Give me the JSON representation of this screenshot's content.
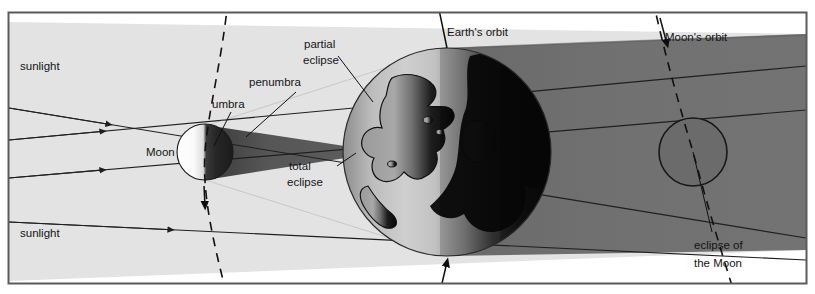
{
  "diagram": {
    "subject": "eclipse of the Moon",
    "labels": {
      "sunlight_top": "sunlight",
      "sunlight_bottom": "sunlight",
      "moon": "Moon",
      "umbra": "umbra",
      "penumbra": "penumbra",
      "partial_eclipse": "partial\neclipse",
      "partial_eclipse_line1": "partial",
      "partial_eclipse_line2": "eclipse",
      "total_eclipse_line1": "total",
      "total_eclipse_line2": "eclipse",
      "earths_orbit": "Earth's orbit",
      "moons_orbit": "Moon's orbit",
      "eclipse_of_moon_line1": "eclipse of",
      "eclipse_of_moon_line2": "the Moon"
    },
    "colors": {
      "frame_border": "#5a5a5a",
      "page_background": "#ffffff",
      "sunlight_beam": "#e3e3e3",
      "penumbra_fill": "#e1e1e1",
      "umbra_fill": "#4c4c4c",
      "earth_shadow": "#6e6e6e",
      "earth_lit": "#b6b6b6",
      "earth_dark": "#111111",
      "moon_lit": "#fbfbfb",
      "moon_dark": "#2a2a2a",
      "eclipsed_moon": "#6a6a6a",
      "ray_stroke": "#1f1f1f",
      "text": "#141414"
    },
    "elements": {
      "moon_left": "half-lit moon at left casting shadow cone",
      "earth": "earth sphere with continents and day/night terminator",
      "moon_right": "moon inside earth's shadow (eclipsed)",
      "sun_rays_count": 4,
      "earth_orbit_style": "solid line with arrowhead",
      "moon_orbit_style": "dashed curve with arrowheads"
    }
  }
}
